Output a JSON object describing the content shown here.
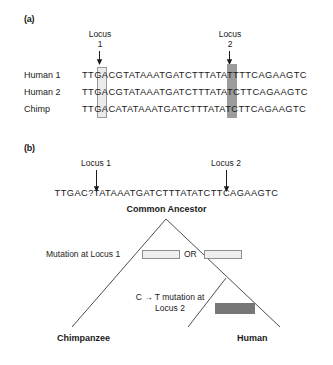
{
  "figure": {
    "panel_a": {
      "label": "(a)",
      "locus1_header": "Locus\n1",
      "locus2_header": "Locus\n2",
      "rows": [
        {
          "name": "Human 1",
          "sequence": "TTGACGTATAAATGATCTTTATATTTTCAGAAGTC",
          "locus1_base": "G",
          "locus2_base": "T"
        },
        {
          "name": "Human 2",
          "sequence": "TTGACGTATAAATGATCTTTATATCTTCAGAAGTC",
          "locus1_base": "G",
          "locus2_base": "C"
        },
        {
          "name": "Chimp",
          "sequence": "TTGACATATAAATGATCTTTATATCTTCAGAAGTC",
          "locus1_base": "A",
          "locus2_base": "C"
        }
      ]
    },
    "panel_b": {
      "label": "(b)",
      "locus1_header": "Locus 1",
      "locus2_header": "Locus 2",
      "ancestor_sequence": "TTGAC?TATAAATGATCTTTATATCTTCAGAAGTC",
      "common_ancestor_label": "Common Ancestor",
      "mutation_locus1_label": "Mutation at Locus 1",
      "or_label": "OR",
      "mutation_locus2_label": "C → T mutation\nat Locus 2",
      "taxa": [
        {
          "name": "Chimpanzee"
        },
        {
          "name": "Human"
        }
      ]
    }
  },
  "colors": {
    "background": "#ffffff",
    "text": "#1a1a1a",
    "highlight_light": "#ebebeb",
    "highlight_light_border": "#9a9a9a",
    "highlight_dark": "#9c9c9c",
    "mutation_box_dark": "#777777",
    "tree_line": "#3a3a3a"
  }
}
